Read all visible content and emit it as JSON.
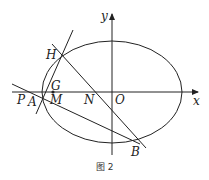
{
  "diagram": {
    "caption": "图 2",
    "axes": {
      "x_label": "x",
      "y_label": "y"
    },
    "points": {
      "H": "H",
      "G": "G",
      "P": "P",
      "A": "A",
      "M": "M",
      "N": "N",
      "O": "O",
      "B": "B"
    },
    "colors": {
      "stroke": "#222222",
      "background": "#ffffff"
    }
  }
}
